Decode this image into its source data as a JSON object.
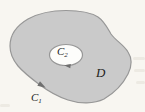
{
  "figure": {
    "type": "math-diagram",
    "labels": {
      "region": "D",
      "outer_curve": {
        "base": "C",
        "sub": "1"
      },
      "inner_curve": {
        "base": "C",
        "sub": "2"
      }
    },
    "icons": {
      "outer_arrow": "arrowhead-counterclockwise",
      "inner_arrow": "arrowhead-clockwise"
    },
    "colors": {
      "background": "#f8f6f1",
      "region_fill": "#cacaca",
      "boundary_stroke": "#979797",
      "hole_fill": "#fdfdfb",
      "arrow": "#6f6f6f",
      "label_text": "#1e1e1c",
      "artifact": "#d9d5ca"
    }
  }
}
